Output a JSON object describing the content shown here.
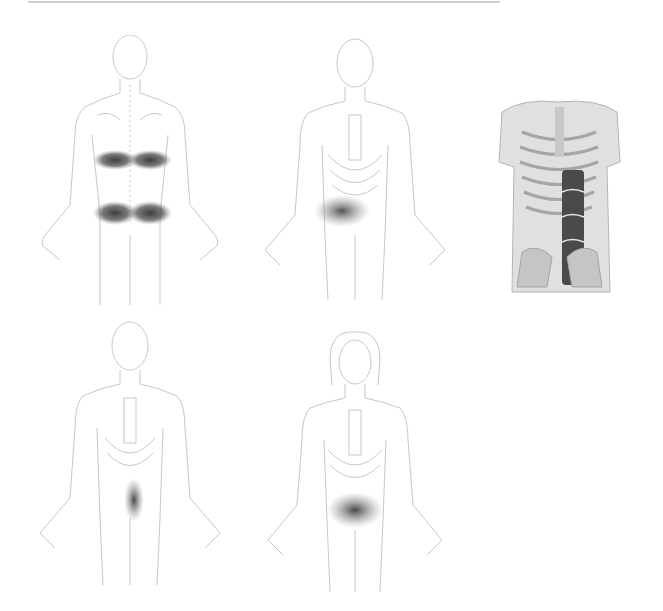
{
  "figure": {
    "colors": {
      "outline": "#c8c8c8",
      "pain_shade": "#3a3a3a",
      "muscle_dark": "#4a4a4a",
      "skin": "#d9d9d9",
      "rule": "#cfcfcf"
    },
    "panels": [
      {
        "id": "back-view",
        "view": "posterior",
        "sex": "male",
        "pain_regions": [
          "mid-back band",
          "low-back band"
        ]
      },
      {
        "id": "front-view-right-abdomen",
        "view": "anterior",
        "sex": "male",
        "pain_regions": [
          "right lower abdomen"
        ]
      },
      {
        "id": "muscle-illustration",
        "view": "anterior",
        "subject": "rectus abdominis muscle on skeleton"
      },
      {
        "id": "front-view-lower-rectus",
        "view": "anterior",
        "sex": "male",
        "pain_regions": [
          "lower right rectus"
        ]
      },
      {
        "id": "front-view-female-lower-abdomen",
        "view": "anterior",
        "sex": "female",
        "pain_regions": [
          "lower abdomen band"
        ]
      }
    ]
  }
}
